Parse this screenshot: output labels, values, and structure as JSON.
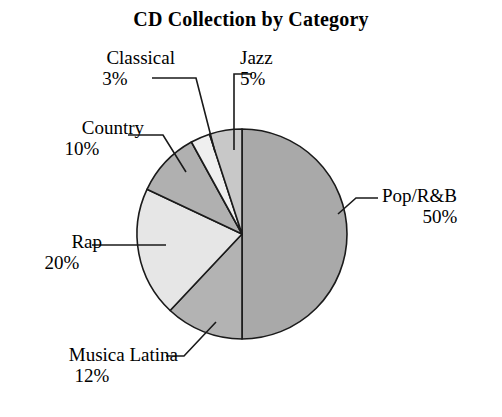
{
  "chart_data": {
    "type": "pie",
    "title": "CD Collection by Category",
    "xlabel": "",
    "ylabel": "",
    "legend_position": "none",
    "grid": false,
    "categories": [
      "Pop/R&B",
      "Musica Latina",
      "Rap",
      "Country",
      "Classical",
      "Jazz"
    ],
    "values": [
      50,
      12,
      20,
      10,
      3,
      5
    ],
    "unit": "%",
    "start_angle_deg": 0,
    "direction": "clockwise",
    "slices": [
      {
        "label": "Pop/R&B",
        "value": 50,
        "value_text": "50%",
        "color": "#a9a9a9"
      },
      {
        "label": "Musica Latina",
        "value": 12,
        "value_text": "12%",
        "color": "#b3b3b3"
      },
      {
        "label": "Rap",
        "value": 20,
        "value_text": "20%",
        "color": "#e6e6e6"
      },
      {
        "label": "Country",
        "value": 10,
        "value_text": "10%",
        "color": "#b0b0b0"
      },
      {
        "label": "Classical",
        "value": 3,
        "value_text": "3%",
        "color": "#efefef"
      },
      {
        "label": "Jazz",
        "value": 5,
        "value_text": "5%",
        "color": "#c8c8c8"
      }
    ]
  },
  "labels": {
    "classical": {
      "name": "Classical",
      "pct": "3%"
    },
    "jazz": {
      "name": "Jazz",
      "pct": "5%"
    },
    "country": {
      "name": "Country",
      "pct": "10%"
    },
    "rap": {
      "name": "Rap",
      "pct": "20%"
    },
    "musica": {
      "name": "Musica Latina",
      "pct": "12%"
    },
    "pop": {
      "name": "Pop/R&B",
      "pct": "50%"
    }
  },
  "style": {
    "background": "#ffffff",
    "outline_color": "#1a1a1a",
    "text_color": "#000000"
  }
}
